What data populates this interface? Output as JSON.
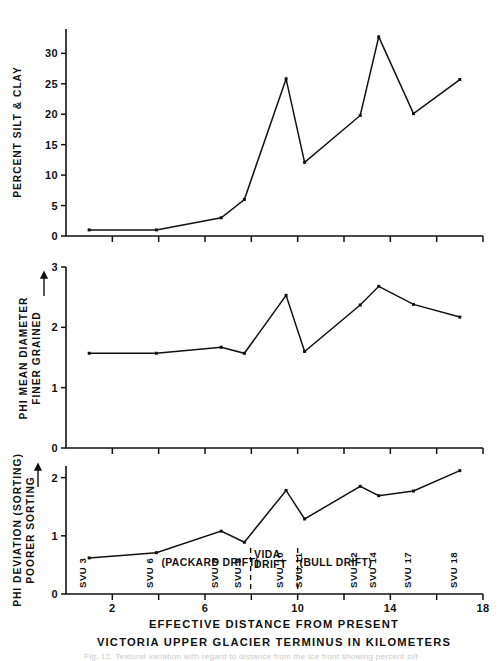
{
  "figure": {
    "x_axis": {
      "title_line1": "EFFECTIVE DISTANCE FROM PRESENT",
      "title_line2": "VICTORIA  UPPER GLACIER TERMINUS IN  KILOMETERS",
      "ticks_major": [
        2,
        6,
        10,
        14,
        18
      ],
      "tick_labels": [
        "2",
        "6",
        "10",
        "14",
        "18"
      ],
      "ticks_minor": [
        4,
        8,
        12,
        16
      ],
      "range": [
        0,
        18
      ]
    },
    "sample_labels": [
      "SVU 3",
      "SVU 6",
      "SVU 8",
      "SVU 9",
      "SVU 10",
      "SVU 11",
      "SVU 12",
      "SVU 14",
      "SVU 17",
      "SVU 18"
    ],
    "drift_annotations": [
      {
        "label": "(PACKARD DRIFT)",
        "x": 4.05
      },
      {
        "label": "VIDA",
        "label2": "DRIFT",
        "x": 8.05
      },
      {
        "label": "(BULL DRIFT)",
        "x": 9.95
      }
    ],
    "caption_faint": "Fig. 12.  Textural variation with regard to distance from the ice front showing percent silt"
  },
  "chart_data": [
    {
      "type": "line",
      "panel": "top",
      "title": "",
      "xlabel": "EFFECTIVE DISTANCE FROM PRESENT VICTORIA UPPER GLACIER TERMINUS IN KILOMETERS",
      "ylabel": "PERCENT SILT & CLAY",
      "xlim": [
        0,
        18
      ],
      "ylim": [
        0,
        34
      ],
      "ytick_labels": [
        "0",
        "5",
        "10",
        "15",
        "20",
        "25",
        "30"
      ],
      "yticks": [
        0,
        5,
        10,
        15,
        20,
        25,
        30
      ],
      "grid": false,
      "legend": "none",
      "x": [
        1.0,
        3.9,
        6.7,
        7.7,
        9.5,
        10.3,
        12.7,
        13.5,
        15.0,
        17.0
      ],
      "values": [
        1.0,
        1.0,
        3.0,
        6.0,
        25.8,
        12.1,
        19.8,
        32.7,
        20.1,
        25.7
      ],
      "point_labels": [
        "SVU 3",
        "SVU 6",
        "SVU 8",
        "SVU 9",
        "SVU 10",
        "SVU 11",
        "SVU 12",
        "SVU 14",
        "SVU 17",
        "SVU 18"
      ]
    },
    {
      "type": "line",
      "panel": "middle",
      "title": "",
      "xlabel": "EFFECTIVE DISTANCE FROM PRESENT VICTORIA UPPER GLACIER TERMINUS IN KILOMETERS",
      "ylabel": "PHI MEAN DIAMETER / FINER GRAINED",
      "ylabel_line1": "PHI MEAN DIAMETER",
      "ylabel_line2": "FINER GRAINED",
      "xlim": [
        0,
        18
      ],
      "ylim": [
        0,
        3
      ],
      "ytick_labels": [
        "0",
        "1",
        "2",
        "3"
      ],
      "yticks": [
        0,
        1,
        2,
        3
      ],
      "grid": false,
      "legend": "none",
      "x": [
        1.0,
        3.9,
        6.7,
        7.7,
        9.5,
        10.3,
        12.7,
        13.5,
        15.0,
        17.0
      ],
      "values": [
        1.57,
        1.57,
        1.67,
        1.57,
        2.53,
        1.6,
        2.37,
        2.68,
        2.38,
        2.17
      ],
      "point_labels": [
        "SVU 3",
        "SVU 6",
        "SVU 8",
        "SVU 9",
        "SVU 10",
        "SVU 11",
        "SVU 12",
        "SVU 14",
        "SVU 17",
        "SVU 18"
      ]
    },
    {
      "type": "line",
      "panel": "bottom",
      "title": "",
      "xlabel": "EFFECTIVE DISTANCE FROM PRESENT VICTORIA UPPER GLACIER TERMINUS IN KILOMETERS",
      "ylabel": "PHI DEVIATION (SORTING) / POORER SORTING",
      "ylabel_line1": "PHI DEVIATION (SORTING)",
      "ylabel_line2": "POORER SORTING",
      "xlim": [
        0,
        18
      ],
      "ylim": [
        0,
        2.2
      ],
      "ytick_labels": [
        "0",
        "1",
        "2"
      ],
      "yticks": [
        0,
        1,
        2
      ],
      "grid": false,
      "legend": "none",
      "x": [
        1.0,
        3.9,
        6.7,
        7.7,
        9.5,
        10.3,
        12.7,
        13.5,
        15.0,
        17.0
      ],
      "values": [
        0.62,
        0.71,
        1.08,
        0.89,
        1.78,
        1.29,
        1.85,
        1.69,
        1.77,
        2.12
      ],
      "point_labels": [
        "SVU 3",
        "SVU 6",
        "SVU 8",
        "SVU 9",
        "SVU 10",
        "SVU 11",
        "SVU 12",
        "SVU 14",
        "SVU 17",
        "SVU 18"
      ]
    }
  ]
}
